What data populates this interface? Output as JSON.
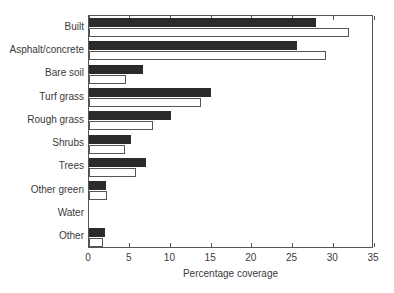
{
  "chart_data": {
    "type": "bar",
    "orientation": "horizontal",
    "title": "",
    "xlabel": "Percentage coverage",
    "ylabel": "",
    "xlim": [
      0,
      35
    ],
    "xticks": [
      0,
      5,
      10,
      15,
      20,
      25,
      30,
      35
    ],
    "xticklabels": [
      "0",
      "5",
      "10",
      "15",
      "20",
      "25",
      "30",
      "35"
    ],
    "grid": false,
    "legend": "none",
    "categories": [
      "Built",
      "Asphalt/concrete",
      "Bare soil",
      "Turf grass",
      "Rough grass",
      "Shrubs",
      "Trees",
      "Other green",
      "Water",
      "Other"
    ],
    "series": [
      {
        "name": "Series 1",
        "color": "#2b2b2b",
        "fill": "solid-black",
        "values": [
          27.9,
          25.5,
          6.6,
          15.0,
          10.1,
          5.2,
          7.0,
          2.1,
          0.0,
          2.0
        ]
      },
      {
        "name": "Series 2",
        "color": "#ffffff",
        "fill": "white-outline",
        "values": [
          31.9,
          29.1,
          4.5,
          13.8,
          7.9,
          4.4,
          5.8,
          2.2,
          0.0,
          1.7
        ]
      }
    ]
  },
  "axis": {
    "x_title": "Percentage coverage"
  },
  "colors": {
    "dark_bar": "#2b2b2b",
    "light_bar": "#ffffff",
    "axis": "#555555",
    "text": "#3a3a3a",
    "background": "#ffffff"
  }
}
